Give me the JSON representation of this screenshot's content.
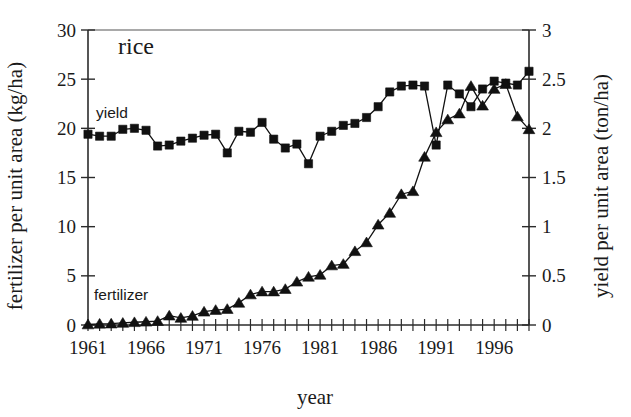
{
  "chart_data": {
    "type": "line",
    "title": "rice",
    "xlabel": "year",
    "ylabel": "fertilizer per unit area (kg/ha)",
    "y2label": "yield per unit area (ton/ha)",
    "xlim": [
      1961,
      1999
    ],
    "ylim": [
      0,
      30
    ],
    "y2lim": [
      0,
      3
    ],
    "xticks": [
      1961,
      1966,
      1971,
      1976,
      1981,
      1986,
      1991,
      1996
    ],
    "xtick_labels": [
      "1961",
      "1966",
      "1971",
      "1976",
      "1981",
      "1986",
      "1991",
      "1996"
    ],
    "yticks": [
      0,
      5,
      10,
      15,
      20,
      25,
      30
    ],
    "ytick_labels": [
      "0",
      "5",
      "10",
      "15",
      "20",
      "25",
      "30"
    ],
    "y2ticks": [
      0,
      0.5,
      1,
      1.5,
      2,
      2.5,
      3
    ],
    "y2tick_labels": [
      "0",
      "0.5",
      "1",
      "1.5",
      "2",
      "2.5",
      "3"
    ],
    "grid": false,
    "legend_position": "inline-annotations",
    "x": [
      1961,
      1962,
      1963,
      1964,
      1965,
      1966,
      1967,
      1968,
      1969,
      1970,
      1971,
      1972,
      1973,
      1974,
      1975,
      1976,
      1977,
      1978,
      1979,
      1980,
      1981,
      1982,
      1983,
      1984,
      1985,
      1986,
      1987,
      1988,
      1989,
      1990,
      1991,
      1992,
      1993,
      1994,
      1995,
      1996,
      1997,
      1998,
      1999
    ],
    "series": [
      {
        "name": "yield",
        "axis": "right",
        "units": "ton/ha",
        "marker": "square",
        "annotation": "yield",
        "values": [
          1.94,
          1.92,
          1.92,
          1.99,
          2.0,
          1.98,
          1.82,
          1.83,
          1.87,
          1.9,
          1.93,
          1.94,
          1.75,
          1.97,
          1.96,
          2.06,
          1.89,
          1.8,
          1.84,
          1.64,
          1.92,
          1.97,
          2.03,
          2.05,
          2.11,
          2.22,
          2.37,
          2.43,
          2.44,
          2.43,
          1.83,
          2.44,
          2.35,
          2.22,
          2.4,
          2.48,
          2.46,
          2.44,
          2.58
        ]
      },
      {
        "name": "fertilizer",
        "axis": "left",
        "units": "kg/ha",
        "marker": "triangle",
        "annotation": "fertilizer",
        "values": [
          0.05,
          0.12,
          0.14,
          0.21,
          0.28,
          0.33,
          0.4,
          0.95,
          0.72,
          0.92,
          1.35,
          1.52,
          1.62,
          2.25,
          3.1,
          3.4,
          3.4,
          3.65,
          4.4,
          4.9,
          5.1,
          6.05,
          6.2,
          7.5,
          8.4,
          10.2,
          11.4,
          13.3,
          13.6,
          17.1,
          19.6,
          20.9,
          21.5,
          24.3,
          22.3,
          24.0,
          24.5,
          21.2,
          19.9
        ]
      }
    ]
  },
  "annotations": {
    "title": "rice",
    "yield_label": "yield",
    "fertilizer_label": "fertilizer",
    "x_axis_title": "year",
    "left_axis_title": "fertilizer per unit area (kg/ha)",
    "right_axis_title": "yield per unit area (ton/ha)"
  },
  "colors": {
    "ink": "#111111",
    "axis": "#2b2b2b",
    "frame": "#555555",
    "background": "#ffffff"
  }
}
